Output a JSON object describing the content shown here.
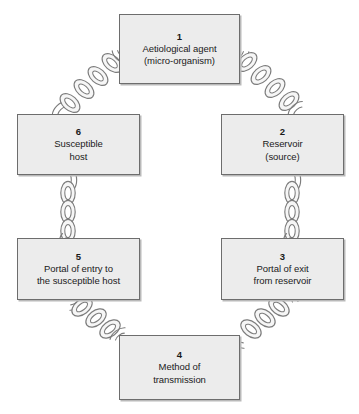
{
  "diagram": {
    "type": "cycle-diagram",
    "colors": {
      "background": "#ffffff",
      "node_fill": "#ececec",
      "node_border": "#6d6d6d",
      "node_shadow": "#b9b9b9",
      "chain_stroke": "#7a7a7a",
      "chain_fill": "#f4f4f4",
      "text": "#1a1a1a"
    },
    "nodes": [
      {
        "id": "aetiological-agent",
        "number": "1",
        "label": "Aetiological agent\n(micro-organism)"
      },
      {
        "id": "reservoir",
        "number": "2",
        "label": "Reservoir\n(source)"
      },
      {
        "id": "portal-of-exit",
        "number": "3",
        "label": "Portal of exit\nfrom reservoir"
      },
      {
        "id": "method-of-transmission",
        "number": "4",
        "label": "Method of\ntransmission"
      },
      {
        "id": "portal-of-entry",
        "number": "5",
        "label": "Portal of entry to\nthe susceptible host"
      },
      {
        "id": "susceptible-host",
        "number": "6",
        "label": "Susceptible\nhost"
      }
    ],
    "connectors": [
      {
        "id": "link-1-2",
        "from": "1",
        "to": "2",
        "style": "chain",
        "orientation": "diagonal-down-right"
      },
      {
        "id": "link-2-3",
        "from": "2",
        "to": "3",
        "style": "chain",
        "orientation": "vertical"
      },
      {
        "id": "link-3-4",
        "from": "3",
        "to": "4",
        "style": "chain",
        "orientation": "diagonal-down-left"
      },
      {
        "id": "link-4-5",
        "from": "4",
        "to": "5",
        "style": "chain",
        "orientation": "diagonal-up-left"
      },
      {
        "id": "link-5-6",
        "from": "5",
        "to": "6",
        "style": "chain",
        "orientation": "vertical"
      },
      {
        "id": "link-6-1",
        "from": "6",
        "to": "1",
        "style": "chain",
        "orientation": "diagonal-up-right"
      }
    ]
  }
}
